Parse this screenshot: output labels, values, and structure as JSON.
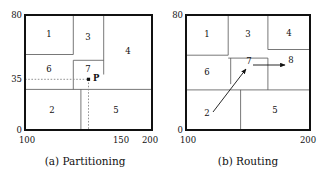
{
  "figure": {
    "panels": [
      {
        "id": "panel-a",
        "caption": "(a) Partitioning",
        "axis": {
          "x_min_label": "100",
          "x_mid_label": "150",
          "x_max_label": "200",
          "y_min_label": "0",
          "y_mid_label": "35",
          "y_max_label": "80"
        },
        "frame": {
          "x0": 100,
          "x1": 200,
          "y0": 0,
          "y1": 80
        },
        "regions": [
          {
            "label": "1",
            "x0": 100,
            "x1": 138,
            "y0": 52,
            "y1": 80,
            "cx": 119,
            "cy": 66
          },
          {
            "label": "3",
            "x0": 138,
            "x1": 162,
            "y0": 48,
            "y1": 80,
            "cx": 150,
            "cy": 64
          },
          {
            "label": "4",
            "x0": 162,
            "x1": 200,
            "y0": 28,
            "y1": 80,
            "cx": 181,
            "cy": 54
          },
          {
            "label": "6",
            "x0": 100,
            "x1": 138,
            "y0": 28,
            "y1": 52,
            "cx": 119,
            "cy": 40
          },
          {
            "label": "7",
            "x0": 138,
            "x1": 162,
            "y0": 28,
            "y1": 48,
            "cx": 150,
            "cy": 38
          },
          {
            "label": "2",
            "x0": 100,
            "x1": 144,
            "y0": 0,
            "y1": 28,
            "cx": 122,
            "cy": 13
          },
          {
            "label": "5",
            "x0": 144,
            "x1": 200,
            "y0": 0,
            "y1": 28,
            "cx": 172,
            "cy": 13
          }
        ],
        "point": {
          "label": "P",
          "x": 150,
          "y": 35,
          "guide_style": "dotted"
        }
      },
      {
        "id": "panel-b",
        "caption": "(b) Routing",
        "axis": {
          "x_min_label": "100",
          "x_max_label": "200",
          "y_min_label": "0",
          "y_max_label": "80"
        },
        "frame": {
          "x0": 100,
          "x1": 200,
          "y0": 0,
          "y1": 80
        },
        "regions": [
          {
            "label": "1",
            "x0": 100,
            "x1": 134,
            "y0": 52,
            "y1": 80,
            "cx": 117,
            "cy": 66
          },
          {
            "label": "3",
            "x0": 134,
            "x1": 166,
            "y0": 50,
            "y1": 80,
            "cx": 150,
            "cy": 66
          },
          {
            "label": "4",
            "x0": 166,
            "x1": 200,
            "y0": 56,
            "y1": 80,
            "cx": 183,
            "cy": 67
          },
          {
            "label": "6",
            "x0": 100,
            "x1": 136,
            "y0": 28,
            "y1": 52,
            "cx": 118,
            "cy": 40
          },
          {
            "label": "7",
            "x0": 136,
            "x1": 166,
            "y0": 32,
            "y1": 50,
            "cx": 152,
            "cy": 44
          },
          {
            "label": "8",
            "x0": 166,
            "x1": 200,
            "y0": 28,
            "y1": 56,
            "cx": 186,
            "cy": 44
          },
          {
            "label": "2",
            "x0": 100,
            "x1": 144,
            "y0": 0,
            "y1": 28,
            "cx": 118,
            "cy": 12
          },
          {
            "label": "5",
            "x0": 144,
            "x1": 200,
            "y0": 0,
            "y1": 28,
            "cx": 172,
            "cy": 13
          }
        ],
        "arrows": [
          {
            "name": "arrow-2-to-7",
            "from": {
              "x": 122,
              "y": 10
            },
            "to": {
              "x": 147,
              "y": 41
            }
          },
          {
            "name": "arrow-7-to-8",
            "from": {
              "x": 152,
              "y": 40
            },
            "to": {
              "x": 180,
              "y": 40
            }
          }
        ]
      }
    ]
  }
}
